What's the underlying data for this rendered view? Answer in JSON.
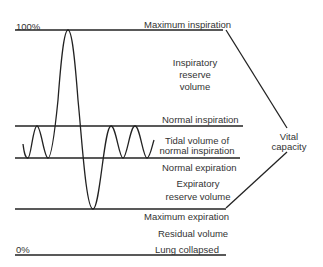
{
  "diagram": {
    "type": "spirogram",
    "axis": {
      "top_label": "100%",
      "bottom_label": "0%"
    },
    "levels": {
      "max_inspiration": "Maximum inspiration",
      "normal_inspiration": "Normal inspiration",
      "normal_expiration": "Normal expiration",
      "max_expiration": "Maximum expiration",
      "lung_collapsed": "Lung collapsed"
    },
    "volumes": {
      "irv_1": "Inspiratory",
      "irv_2": "reserve",
      "irv_3": "volume",
      "tv_1": "Tidal volume of",
      "tv_2": "normal inspiration",
      "erv_1": "Expiratory",
      "erv_2": "reserve volume",
      "rv": "Residual volume"
    },
    "bracket": {
      "label_1": "Vital",
      "label_2": "capacity"
    },
    "colors": {
      "line": "#222222",
      "text": "#333333",
      "background": "#ffffff"
    }
  }
}
